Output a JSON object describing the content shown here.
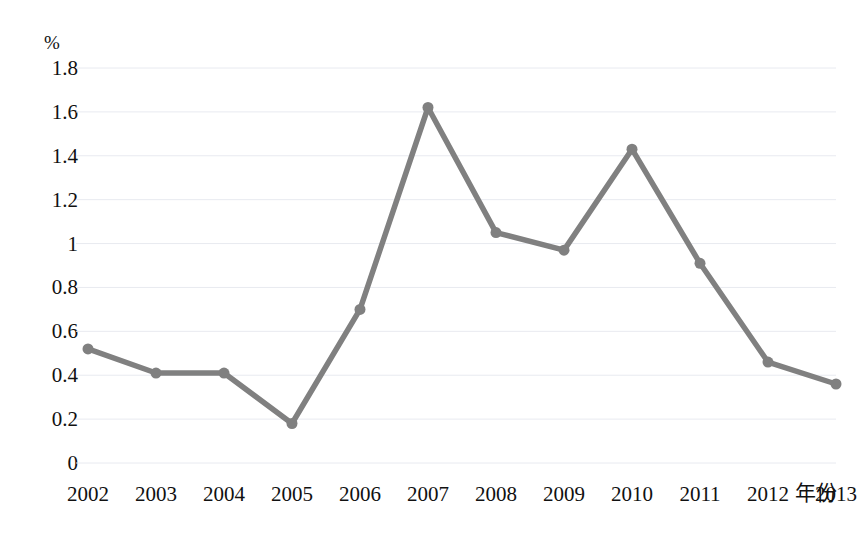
{
  "chart_data": {
    "type": "line",
    "title": "",
    "subtitle": "",
    "xlabel": "年份",
    "ylabel": "%",
    "categories": [
      "2002",
      "2003",
      "2004",
      "2005",
      "2006",
      "2007",
      "2008",
      "2009",
      "2010",
      "2011",
      "2012",
      "2013"
    ],
    "x": [
      2002,
      2003,
      2004,
      2005,
      2006,
      2007,
      2008,
      2009,
      2010,
      2011,
      2012,
      2013
    ],
    "values": [
      0.52,
      0.41,
      0.41,
      0.18,
      0.7,
      1.62,
      1.05,
      0.97,
      1.43,
      0.91,
      0.46,
      0.36
    ],
    "series": [
      {
        "name": "",
        "values": [
          0.52,
          0.41,
          0.41,
          0.18,
          0.7,
          1.62,
          1.05,
          0.97,
          1.43,
          0.91,
          0.46,
          0.36
        ]
      }
    ],
    "ylim": [
      0,
      1.8
    ],
    "ytick_labels": [
      "1.8",
      "1.6",
      "1.4",
      "1.2",
      "1",
      "0.8",
      "0.6",
      "0.4",
      "0.2",
      "0"
    ],
    "yticks": [
      1.8,
      1.6,
      1.4,
      1.2,
      1.0,
      0.8,
      0.6,
      0.4,
      0.2,
      0
    ],
    "grid": true,
    "grid_axis": "y",
    "legend": false,
    "legend_position": "none",
    "series_color": "#808080",
    "gridline_color": "#e8eaf0",
    "background_color": "#ffffff",
    "marker": "circle",
    "marker_size": 11
  },
  "axes": {
    "y_unit": "%",
    "x_title": "年份"
  },
  "plot_geometry": {
    "left": 88,
    "right": 836,
    "top": 68,
    "bottom": 463
  }
}
